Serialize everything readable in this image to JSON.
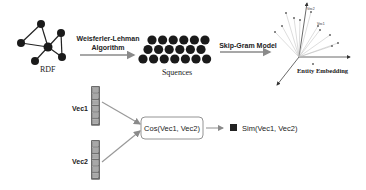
{
  "rdf": {
    "label": "RDF",
    "nodes": [
      {
        "id": "top"
      },
      {
        "id": "left"
      },
      {
        "id": "center"
      },
      {
        "id": "right-top"
      },
      {
        "id": "right-bottom"
      },
      {
        "id": "bottom-left"
      }
    ],
    "edges": [
      [
        "top",
        "left"
      ],
      [
        "top",
        "center"
      ],
      [
        "left",
        "center"
      ],
      [
        "center",
        "right-top"
      ],
      [
        "center",
        "right-bottom"
      ],
      [
        "right-top",
        "right-bottom"
      ],
      [
        "center",
        "bottom-left"
      ]
    ]
  },
  "step1": {
    "label_line1": "Weisferler-Lehman",
    "label_line2": "Algorithm"
  },
  "sequences": {
    "label": "Squences",
    "rows": [
      6,
      6,
      7
    ]
  },
  "step2": {
    "label": "Skip-Gram Model"
  },
  "embedding": {
    "label": "Entity Embedding",
    "vec1_label": "Vec1",
    "vec2_label": "Vec2"
  },
  "vectors": [
    {
      "label": "Vec1",
      "cells": 6
    },
    {
      "label": "Vec2",
      "cells": 6
    }
  ],
  "cosine": {
    "label": "Cos(Vec1, Vec2)"
  },
  "output": {
    "label": "Sim(Vec1, Vec2)"
  },
  "colors": {
    "node": "#1a1a1a",
    "arrow": "#8a8a8a",
    "vector": "#6b6b6b",
    "vector_cell": "#a8a8a8"
  }
}
